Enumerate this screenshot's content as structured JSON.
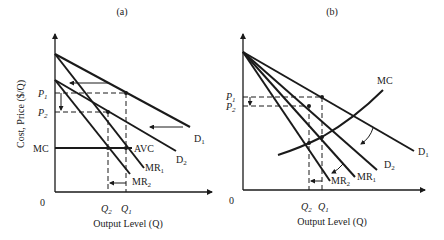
{
  "figure": {
    "panels": [
      {
        "id": "a",
        "title": "(a)",
        "y_axis_label": "Cost, Price ($/Q)",
        "x_axis_label": "Output Level (Q)",
        "origin_label": "0",
        "y_ticks": {
          "p1": "P",
          "p1_sub": "1",
          "p2": "P",
          "p2_sub": "2",
          "mc": "MC"
        },
        "x_ticks": {
          "q2": "Q",
          "q2_sub": "2",
          "q1": "Q",
          "q1_sub": "1"
        },
        "curves": {
          "d1": "D",
          "d1_sub": "1",
          "d2": "D",
          "d2_sub": "2",
          "mr1": "MR",
          "mr1_sub": "1",
          "mr2": "MR",
          "mr2_sub": "2",
          "avc": "AVC"
        }
      },
      {
        "id": "b",
        "title": "(b)",
        "x_axis_label": "Output Level (Q)",
        "origin_label": "0",
        "y_ticks": {
          "p1": "P",
          "p1_sub": "1",
          "p2": "P",
          "p2_sub": "2"
        },
        "x_ticks": {
          "q2": "Q",
          "q2_sub": "2",
          "q1": "Q",
          "q1_sub": "1"
        },
        "curves": {
          "mc": "MC",
          "d1": "D",
          "d1_sub": "1",
          "d2": "D",
          "d2_sub": "2",
          "mr1": "MR",
          "mr1_sub": "1",
          "mr2": "MR",
          "mr2_sub": "2"
        }
      }
    ]
  }
}
